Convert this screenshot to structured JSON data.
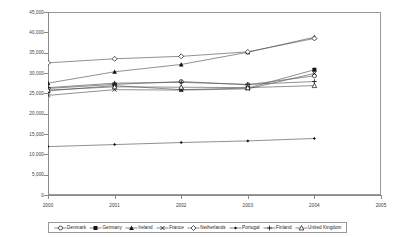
{
  "chart_data": {
    "type": "line",
    "title": "",
    "subtitle": "",
    "xlabel": "",
    "ylabel": "",
    "grid": false,
    "legend_position": "bottom",
    "x": [
      2000,
      2001,
      2002,
      2003,
      2004
    ],
    "xlim": [
      2000,
      2005
    ],
    "ylim": [
      0,
      45000
    ],
    "xticks": [
      "2000",
      "2001",
      "2002",
      "2003",
      "2004",
      "2005"
    ],
    "yticks": [
      "0",
      "5,000",
      "10,000",
      "15,000",
      "20,000",
      "25,000",
      "30,000",
      "35,000",
      "40,000",
      "45,000"
    ],
    "ytick_values": [
      0,
      5000,
      10000,
      15000,
      20000,
      25000,
      30000,
      35000,
      40000,
      45000
    ],
    "series": [
      {
        "name": "Denmark",
        "marker": "circle-open",
        "values": [
          26200,
          27200,
          27900,
          27100,
          29300
        ]
      },
      {
        "name": "Germany",
        "marker": "square-filled",
        "values": [
          25600,
          26900,
          25900,
          26300,
          30800
        ]
      },
      {
        "name": "Ireland",
        "marker": "triangle",
        "values": [
          27500,
          30300,
          32100,
          35100,
          38800
        ]
      },
      {
        "name": "France",
        "marker": "cross",
        "values": [
          24500,
          25900,
          25800,
          26100,
          29900
        ]
      },
      {
        "name": "Netherlands",
        "marker": "diamond-open",
        "values": [
          32500,
          33500,
          34100,
          35200,
          38500
        ]
      },
      {
        "name": "Portugal",
        "marker": "diamond-small",
        "values": [
          11900,
          12400,
          12900,
          13300,
          13900
        ]
      },
      {
        "name": "Finland",
        "marker": "plus",
        "values": [
          26400,
          27500,
          27700,
          27200,
          27900
        ]
      },
      {
        "name": "United Kingdom",
        "marker": "triangle-open",
        "values": [
          25800,
          26600,
          26500,
          26400,
          26900
        ]
      }
    ]
  },
  "legend": {
    "items": [
      {
        "label": "Denmark"
      },
      {
        "label": "Germany"
      },
      {
        "label": "Ireland"
      },
      {
        "label": "France"
      },
      {
        "label": "Netherlands"
      },
      {
        "label": "Portugal"
      },
      {
        "label": "Finland"
      },
      {
        "label": "United Kingdom"
      }
    ]
  },
  "colors": {
    "axis": "#8a8a8a",
    "frame": "#9a9a9a",
    "line": "#555555",
    "marker": "#111111",
    "text": "#3a3a3a",
    "background": "#ffffff"
  }
}
